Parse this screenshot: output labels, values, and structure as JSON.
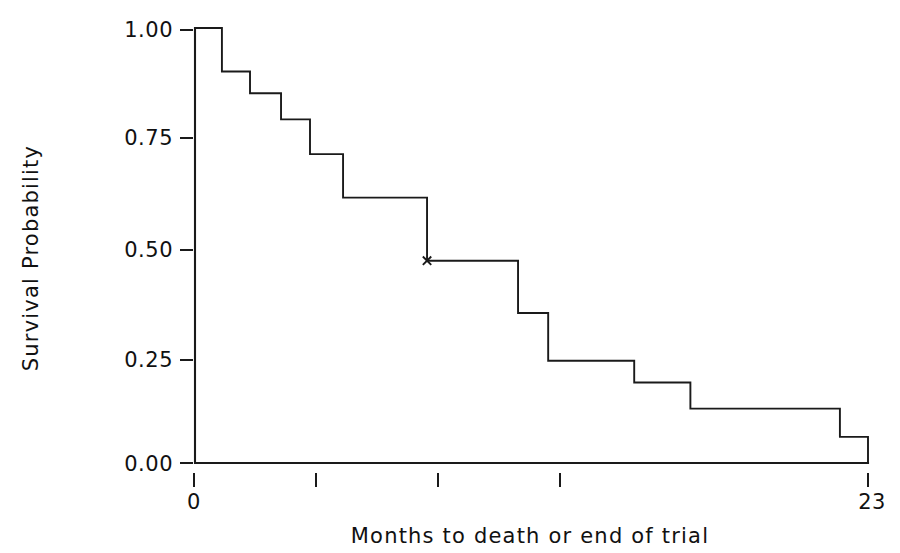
{
  "chart_data": {
    "type": "line",
    "subtype": "kaplan-meier-step",
    "title": "",
    "xlabel": "Months to death or end of trial",
    "ylabel": "Survival Probability",
    "xlim": [
      0,
      23
    ],
    "ylim": [
      0.0,
      1.0
    ],
    "grid": false,
    "legend": "none",
    "x_tick_values": [
      0,
      5.5,
      11,
      16.5,
      23
    ],
    "x_tick_labels": [
      "0",
      "",
      "",
      "",
      "23"
    ],
    "y_tick_values": [
      0.0,
      0.25,
      0.5,
      0.75,
      1.0
    ],
    "y_tick_labels": [
      "0.00",
      "0.25",
      "0.50",
      "0.75",
      "1.00"
    ],
    "series": [
      {
        "name": "Survival",
        "step": "post",
        "x": [
          0.0,
          0.92,
          1.88,
          2.94,
          3.93,
          5.06,
          7.93,
          11.04,
          12.07,
          15.01,
          16.93,
          22.04,
          23.0
        ],
        "y": [
          1.0,
          0.9,
          0.85,
          0.79,
          0.71,
          0.61,
          0.465,
          0.345,
          0.235,
          0.185,
          0.125,
          0.06,
          0.0
        ]
      }
    ],
    "censored_points": [
      {
        "x": 7.93,
        "y": 0.465,
        "marker": "x"
      }
    ]
  },
  "axes": {
    "y_axis_label": "Survival Probability",
    "x_axis_label": "Months to death or end of trial",
    "y_labels": [
      "1.00",
      "0.75",
      "0.50",
      "0.25",
      "0.00"
    ],
    "x_labels": [
      "0",
      "23"
    ]
  }
}
